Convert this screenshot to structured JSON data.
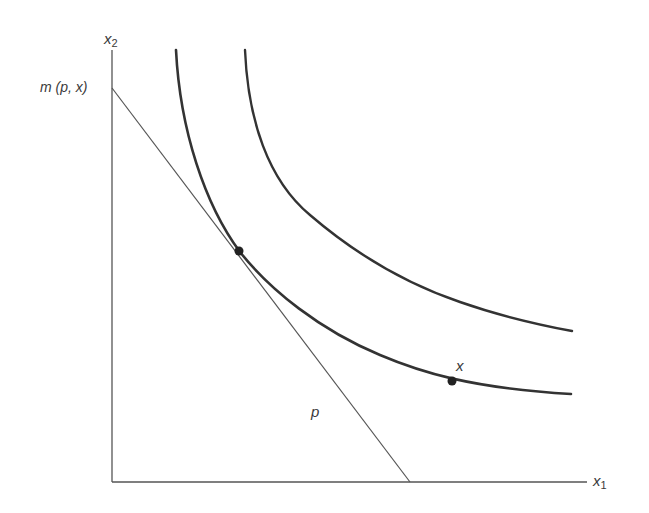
{
  "diagram": {
    "type": "indifference-curve-expenditure-minimization",
    "axes": {
      "x_label": "x",
      "x_sub": "1",
      "y_label": "x",
      "y_sub": "2"
    },
    "labels": {
      "intercept": "m (p, x)",
      "budget_line": "p",
      "point": "x"
    },
    "colors": {
      "line": "#333333",
      "axis": "#555555",
      "budget": "#555555"
    }
  }
}
